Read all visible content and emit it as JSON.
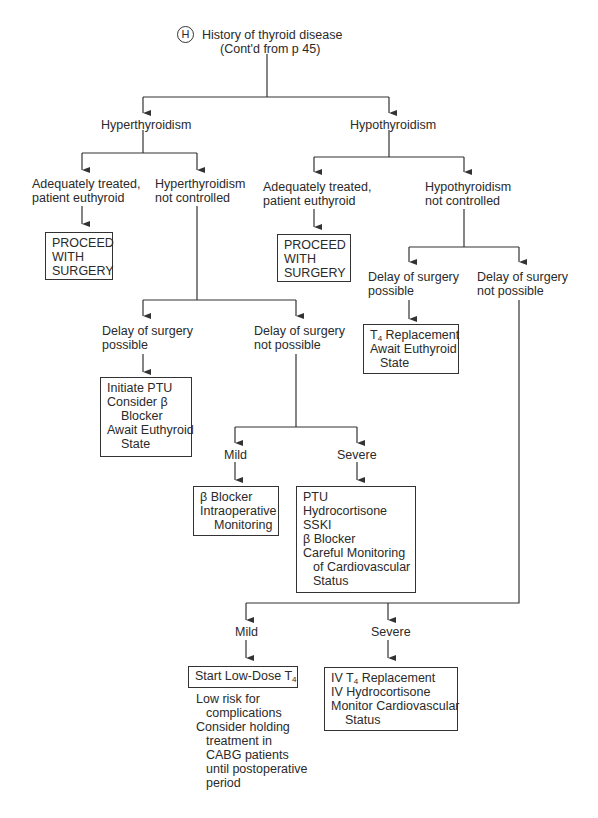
{
  "diagram": {
    "marker": "H",
    "root": {
      "title": "History of thyroid disease",
      "subtitle": "(Cont'd from p 45)"
    },
    "hyper": {
      "label": "Hyperthyroidism",
      "treated": [
        "Adequately treated,",
        "patient euthyroid"
      ],
      "treated_box": [
        "PROCEED",
        "WITH",
        "SURGERY"
      ],
      "not_controlled": [
        "Hyperthyroidism",
        "not controlled"
      ],
      "delay_possible": [
        "Delay of surgery",
        "possible"
      ],
      "delay_possible_box": [
        "Initiate PTU",
        "Consider β",
        "Blocker",
        "Await Euthyroid",
        "State"
      ],
      "delay_not_possible": [
        "Delay of surgery",
        "not possible"
      ],
      "mild": "Mild",
      "mild_box": [
        "β Blocker",
        "Intraoperative",
        "Monitoring"
      ],
      "severe": "Severe",
      "severe_box": [
        "PTU",
        "Hydrocortisone",
        "SSKI",
        "β Blocker",
        "Careful Monitoring",
        "of Cardiovascular",
        "Status"
      ]
    },
    "hypo": {
      "label": "Hypothyroidism",
      "treated": [
        "Adequately treated,",
        "patient euthyroid"
      ],
      "treated_box": [
        "PROCEED",
        "WITH",
        "SURGERY"
      ],
      "not_controlled": [
        "Hypothyroidism",
        "not controlled"
      ],
      "delay_possible": [
        "Delay of surgery",
        "possible"
      ],
      "delay_possible_box": {
        "t_prefix": "T",
        "t_sub": "4",
        "line1_rest": " Replacement",
        "line2": "Await Euthyroid",
        "line3": "State"
      },
      "delay_not_possible": [
        "Delay of surgery",
        "not possible"
      ],
      "mild": "Mild",
      "mild_box": {
        "prefix": "Start Low-Dose T",
        "sub": "4"
      },
      "mild_notes": [
        "Low risk for",
        "complications",
        "Consider holding",
        "treatment in",
        "CABG patients",
        "until postoperative",
        "period"
      ],
      "severe": "Severe",
      "severe_box": {
        "l1_prefix": "IV T",
        "l1_sub": "4",
        "l1_rest": " Replacement",
        "l2": "IV Hydrocortisone",
        "l3": "Monitor Cardiovascular",
        "l4": "Status"
      }
    },
    "colors": {
      "line": "#333333",
      "text": "#2a2a2a",
      "background": "#ffffff"
    }
  }
}
